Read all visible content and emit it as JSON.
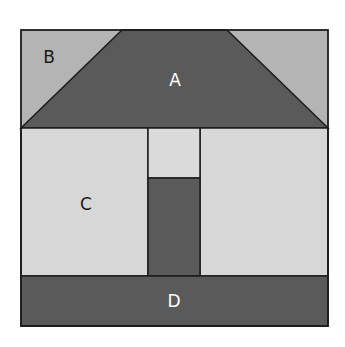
{
  "diagram": {
    "labels": {
      "A": "A",
      "B": "B",
      "C": "C",
      "D": "D"
    },
    "colors": {
      "dark": "#5a5a5a",
      "medium": "#b4b4b4",
      "light": "#d7d7d7",
      "door_window": "#dadada",
      "stroke": "#1c1c1c",
      "label_dark": "#1a1a1a",
      "label_light": "#ffffff",
      "background": "#ffffff"
    }
  }
}
